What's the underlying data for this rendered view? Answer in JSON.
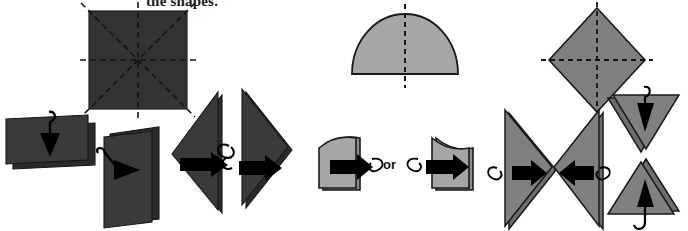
{
  "canvas": {
    "width": 688,
    "height": 231,
    "background": "#ffffff"
  },
  "caption": {
    "text": "the shapes."
  },
  "labels": {
    "or": "or"
  },
  "colors": {
    "dark_fill": "#333333",
    "dark_stroke": "#1c1c1c",
    "mid_gray_fill": "#a6a6a6",
    "mid_gray_stroke": "#1a1a1a",
    "right_gray_fill": "#808080",
    "right_gray_stroke": "#1a1a1a",
    "arrow_black": "#000000",
    "symmetry_dash": "#1a1a1a",
    "background": "#ffffff"
  },
  "groups": [
    {
      "id": "square-group",
      "name": "square-symmetry-group",
      "shape": "square",
      "fill": "#333333",
      "lines_of_symmetry": 4,
      "symmetry_axes": [
        "vertical",
        "horizontal",
        "diagonal-tlbr",
        "diagonal-trbl"
      ],
      "folds": [
        {
          "id": "fold-horizontal",
          "result_shape": "rectangle-wide",
          "arrow": "down",
          "arrow_name": "fold-down-arrow"
        },
        {
          "id": "fold-vertical",
          "result_shape": "rectangle-tall",
          "arrow": "right",
          "arrow_name": "fold-right-arrow"
        },
        {
          "id": "fold-diagonal-left",
          "result_shape": "triangle-left",
          "arrow": "left",
          "arrow_name": "fold-left-arrow"
        },
        {
          "id": "fold-diagonal-right",
          "result_shape": "triangle-right",
          "arrow": "right",
          "arrow_name": "fold-right-arrow"
        }
      ]
    },
    {
      "id": "semicircle-group",
      "name": "semicircle-symmetry-group",
      "shape": "semicircle",
      "fill": "#a6a6a6",
      "lines_of_symmetry": 1,
      "symmetry_axes": [
        "vertical"
      ],
      "folds": [
        {
          "id": "fold-quarter-left",
          "result_shape": "quarter-circle-left",
          "arrow": "left",
          "arrow_name": "fold-left-arrow"
        },
        {
          "id": "fold-quarter-right",
          "result_shape": "quarter-circle-right",
          "arrow": "right",
          "arrow_name": "fold-right-arrow"
        }
      ]
    },
    {
      "id": "rhombus-group",
      "name": "rhombus-symmetry-group",
      "shape": "rhombus",
      "fill": "#808080",
      "lines_of_symmetry": 2,
      "symmetry_axes": [
        "vertical",
        "horizontal"
      ],
      "folds": [
        {
          "id": "fold-left",
          "result_shape": "triangle-right-pointing",
          "arrow": "right",
          "arrow_name": "fold-right-arrow"
        },
        {
          "id": "fold-right",
          "result_shape": "triangle-left-pointing",
          "arrow": "left",
          "arrow_name": "fold-left-arrow"
        },
        {
          "id": "fold-down",
          "result_shape": "triangle-down-pointing",
          "arrow": "down",
          "arrow_name": "fold-down-arrow"
        },
        {
          "id": "fold-up",
          "result_shape": "triangle-up-pointing",
          "arrow": "up",
          "arrow_name": "fold-up-arrow"
        }
      ]
    }
  ]
}
